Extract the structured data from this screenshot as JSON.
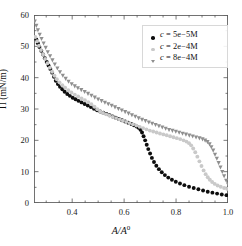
{
  "chart_data": {
    "type": "scatter",
    "title": "",
    "xlabel": "A/A0",
    "xlabel_base": "A/A",
    "xlabel_sup": "0",
    "ylabel": "Π (mN/m)",
    "xlim": [
      0.253,
      1.0
    ],
    "ylim": [
      0,
      60
    ],
    "xticks": [
      0.4,
      0.6,
      0.8,
      1.0
    ],
    "xtick_labels": [
      "0.4",
      "0.6",
      "0.8",
      "1.0"
    ],
    "yticks": [
      0,
      10,
      20,
      30,
      40,
      50,
      60
    ],
    "ytick_labels": [
      "0",
      "10",
      "20",
      "30",
      "40",
      "50",
      "60"
    ],
    "x_minor_ticks": [
      0.3,
      0.35,
      0.45,
      0.5,
      0.55,
      0.65,
      0.7,
      0.75,
      0.85,
      0.9,
      0.95
    ],
    "y_minor_ticks": [
      5,
      15,
      25,
      35,
      45,
      55
    ],
    "grid": false,
    "legend_position": "upper right",
    "series": [
      {
        "name": "c = 5e-5M",
        "label_prefix": "c",
        "label_value": "5e−5M",
        "color": "#0d0d0d",
        "marker": "circle",
        "points": [
          [
            0.262,
            52.2
          ],
          [
            0.268,
            51.0
          ],
          [
            0.274,
            49.8
          ],
          [
            0.281,
            48.6
          ],
          [
            0.288,
            47.4
          ],
          [
            0.295,
            46.2
          ],
          [
            0.302,
            45.0
          ],
          [
            0.309,
            43.9
          ],
          [
            0.316,
            42.8
          ],
          [
            0.323,
            41.6
          ],
          [
            0.33,
            40.3
          ],
          [
            0.337,
            39.0
          ],
          [
            0.345,
            38.0
          ],
          [
            0.353,
            37.1
          ],
          [
            0.362,
            36.3
          ],
          [
            0.371,
            35.5
          ],
          [
            0.381,
            34.8
          ],
          [
            0.391,
            34.2
          ],
          [
            0.402,
            33.6
          ],
          [
            0.413,
            33.1
          ],
          [
            0.424,
            32.6
          ],
          [
            0.436,
            32.1
          ],
          [
            0.448,
            31.6
          ],
          [
            0.46,
            31.1
          ],
          [
            0.472,
            30.6
          ],
          [
            0.484,
            30.1
          ],
          [
            0.496,
            29.6
          ],
          [
            0.508,
            29.2
          ],
          [
            0.52,
            28.8
          ],
          [
            0.532,
            28.4
          ],
          [
            0.544,
            28.0
          ],
          [
            0.556,
            27.6
          ],
          [
            0.568,
            27.2
          ],
          [
            0.58,
            26.8
          ],
          [
            0.592,
            26.4
          ],
          [
            0.604,
            26.0
          ],
          [
            0.616,
            25.6
          ],
          [
            0.628,
            25.2
          ],
          [
            0.638,
            24.8
          ],
          [
            0.648,
            24.4
          ],
          [
            0.656,
            24.0
          ],
          [
            0.663,
            23.4
          ],
          [
            0.669,
            22.5
          ],
          [
            0.675,
            21.3
          ],
          [
            0.681,
            20.0
          ],
          [
            0.687,
            18.6
          ],
          [
            0.693,
            17.2
          ],
          [
            0.7,
            15.8
          ],
          [
            0.707,
            14.4
          ],
          [
            0.715,
            13.1
          ],
          [
            0.724,
            11.9
          ],
          [
            0.734,
            10.8
          ],
          [
            0.745,
            9.8
          ],
          [
            0.757,
            8.9
          ],
          [
            0.77,
            8.1
          ],
          [
            0.784,
            7.4
          ],
          [
            0.799,
            6.8
          ],
          [
            0.815,
            6.2
          ],
          [
            0.832,
            5.7
          ],
          [
            0.85,
            5.2
          ],
          [
            0.868,
            4.8
          ],
          [
            0.886,
            4.4
          ],
          [
            0.904,
            4.0
          ],
          [
            0.922,
            3.6
          ],
          [
            0.94,
            3.3
          ],
          [
            0.958,
            3.0
          ],
          [
            0.976,
            2.7
          ],
          [
            0.994,
            2.5
          ]
        ]
      },
      {
        "name": "c = 2e-4M",
        "label_prefix": "c",
        "label_value": "2e−4M",
        "color": "#c9c9c9",
        "marker": "circle",
        "points": [
          [
            0.258,
            53.0
          ],
          [
            0.265,
            51.6
          ],
          [
            0.272,
            50.2
          ],
          [
            0.28,
            48.8
          ],
          [
            0.288,
            47.4
          ],
          [
            0.296,
            46.0
          ],
          [
            0.305,
            44.6
          ],
          [
            0.314,
            43.2
          ],
          [
            0.323,
            41.9
          ],
          [
            0.332,
            40.6
          ],
          [
            0.341,
            39.5
          ],
          [
            0.351,
            38.5
          ],
          [
            0.362,
            37.6
          ],
          [
            0.373,
            36.8
          ],
          [
            0.385,
            36.0
          ],
          [
            0.397,
            35.3
          ],
          [
            0.41,
            34.6
          ],
          [
            0.423,
            34.0
          ],
          [
            0.436,
            33.4
          ],
          [
            0.449,
            32.8
          ],
          [
            0.462,
            32.2
          ],
          [
            0.474,
            31.5
          ],
          [
            0.486,
            30.7
          ],
          [
            0.497,
            29.9
          ],
          [
            0.508,
            29.2
          ],
          [
            0.519,
            28.7
          ],
          [
            0.531,
            28.3
          ],
          [
            0.543,
            27.9
          ],
          [
            0.556,
            27.5
          ],
          [
            0.569,
            27.1
          ],
          [
            0.582,
            26.7
          ],
          [
            0.595,
            26.3
          ],
          [
            0.608,
            25.9
          ],
          [
            0.621,
            25.5
          ],
          [
            0.634,
            25.1
          ],
          [
            0.647,
            24.7
          ],
          [
            0.66,
            24.3
          ],
          [
            0.673,
            23.9
          ],
          [
            0.686,
            23.5
          ],
          [
            0.699,
            23.1
          ],
          [
            0.712,
            22.8
          ],
          [
            0.725,
            22.5
          ],
          [
            0.738,
            22.2
          ],
          [
            0.751,
            21.9
          ],
          [
            0.764,
            21.6
          ],
          [
            0.777,
            21.3
          ],
          [
            0.79,
            21.0
          ],
          [
            0.803,
            20.7
          ],
          [
            0.816,
            20.4
          ],
          [
            0.829,
            20.0
          ],
          [
            0.84,
            19.6
          ],
          [
            0.85,
            19.1
          ],
          [
            0.858,
            18.4
          ],
          [
            0.866,
            17.4
          ],
          [
            0.874,
            16.2
          ],
          [
            0.882,
            14.8
          ],
          [
            0.89,
            13.3
          ],
          [
            0.898,
            11.8
          ],
          [
            0.906,
            10.4
          ],
          [
            0.914,
            9.2
          ],
          [
            0.922,
            8.2
          ],
          [
            0.93,
            7.4
          ],
          [
            0.939,
            6.7
          ],
          [
            0.949,
            6.1
          ],
          [
            0.96,
            5.6
          ],
          [
            0.972,
            5.2
          ],
          [
            0.985,
            4.8
          ],
          [
            0.997,
            4.5
          ]
        ]
      },
      {
        "name": "c = 8e-4M",
        "label_prefix": "c",
        "label_value": "8e−4M",
        "color": "#8f8f8f",
        "marker": "triangle-down",
        "points": [
          [
            0.256,
            58.0
          ],
          [
            0.262,
            56.6
          ],
          [
            0.268,
            55.2
          ],
          [
            0.275,
            53.8
          ],
          [
            0.282,
            52.4
          ],
          [
            0.29,
            51.0
          ],
          [
            0.298,
            49.6
          ],
          [
            0.306,
            48.2
          ],
          [
            0.315,
            46.9
          ],
          [
            0.324,
            45.6
          ],
          [
            0.333,
            44.3
          ],
          [
            0.343,
            43.0
          ],
          [
            0.353,
            41.8
          ],
          [
            0.364,
            40.7
          ],
          [
            0.375,
            39.7
          ],
          [
            0.386,
            38.8
          ],
          [
            0.398,
            38.0
          ],
          [
            0.41,
            37.3
          ],
          [
            0.422,
            36.7
          ],
          [
            0.435,
            36.1
          ],
          [
            0.448,
            35.5
          ],
          [
            0.461,
            34.9
          ],
          [
            0.474,
            34.3
          ],
          [
            0.487,
            33.7
          ],
          [
            0.5,
            33.1
          ],
          [
            0.513,
            32.6
          ],
          [
            0.526,
            32.1
          ],
          [
            0.539,
            31.6
          ],
          [
            0.552,
            31.1
          ],
          [
            0.565,
            30.6
          ],
          [
            0.578,
            30.1
          ],
          [
            0.591,
            29.6
          ],
          [
            0.604,
            29.1
          ],
          [
            0.617,
            28.6
          ],
          [
            0.63,
            28.1
          ],
          [
            0.643,
            27.6
          ],
          [
            0.656,
            27.1
          ],
          [
            0.669,
            26.6
          ],
          [
            0.682,
            26.2
          ],
          [
            0.695,
            25.8
          ],
          [
            0.708,
            25.4
          ],
          [
            0.721,
            25.0
          ],
          [
            0.734,
            24.6
          ],
          [
            0.747,
            24.2
          ],
          [
            0.76,
            23.8
          ],
          [
            0.773,
            23.4
          ],
          [
            0.786,
            23.1
          ],
          [
            0.799,
            22.8
          ],
          [
            0.812,
            22.5
          ],
          [
            0.825,
            22.2
          ],
          [
            0.838,
            21.9
          ],
          [
            0.851,
            21.6
          ],
          [
            0.864,
            21.3
          ],
          [
            0.877,
            21.0
          ],
          [
            0.89,
            20.7
          ],
          [
            0.902,
            20.4
          ],
          [
            0.912,
            20.0
          ],
          [
            0.921,
            19.5
          ],
          [
            0.929,
            18.8
          ],
          [
            0.936,
            17.9
          ],
          [
            0.943,
            16.8
          ],
          [
            0.95,
            15.5
          ],
          [
            0.957,
            14.2
          ],
          [
            0.964,
            12.8
          ],
          [
            0.971,
            11.4
          ],
          [
            0.978,
            10.0
          ],
          [
            0.985,
            8.6
          ],
          [
            0.993,
            7.2
          ],
          [
            1.0,
            6.0
          ]
        ]
      }
    ]
  }
}
